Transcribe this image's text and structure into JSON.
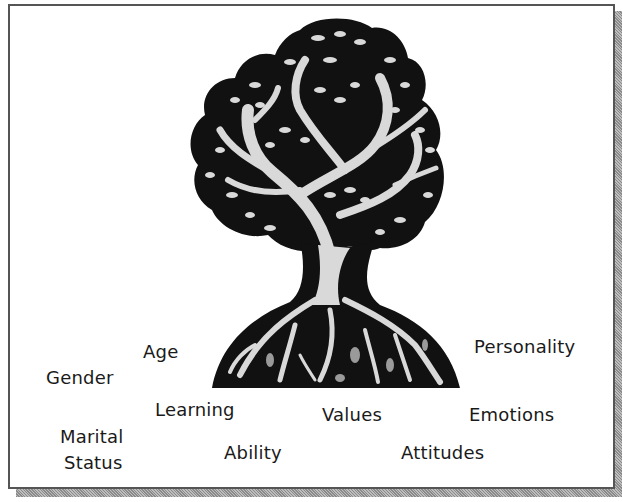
{
  "diagram": {
    "type": "tree-illustration",
    "figure": "tree-with-roots",
    "colors": {
      "ink": "#111111",
      "highlight": "#d9d9d9",
      "frame_border": "#555555",
      "background": "#ffffff"
    },
    "labels": {
      "personality": "Personality",
      "age": "Age",
      "gender": "Gender",
      "learning": "Learning",
      "values": "Values",
      "emotions": "Emotions",
      "marital_line1": "Marital",
      "marital_line2": "Status",
      "ability": "Ability",
      "attitudes": "Attitudes"
    }
  }
}
